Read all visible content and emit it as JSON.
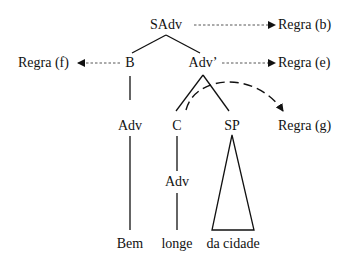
{
  "diagram": {
    "type": "syntax-tree",
    "nodes": {
      "sadv": "SAdv",
      "b": "B",
      "adv_bar": "Adv’",
      "adv_b": "Adv",
      "c": "C",
      "sp": "SP",
      "adv_c": "Adv",
      "bem": "Bem",
      "longe": "longe",
      "da_cidade": "da cidade"
    },
    "rules": {
      "b": "Regra (b)",
      "e": "Regra (e)",
      "f": "Regra (f)",
      "g": "Regra (g)"
    },
    "colors": {
      "ink": "#111111",
      "background": "#ffffff"
    }
  }
}
